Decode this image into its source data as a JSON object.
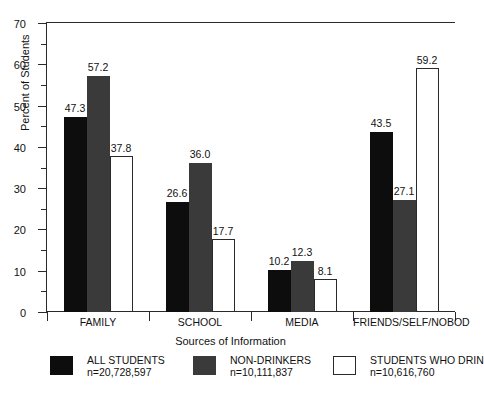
{
  "chart_data": {
    "type": "bar",
    "title": "",
    "xlabel": "Sources of Information",
    "ylabel": "Percent of Students",
    "ylim": [
      0,
      70
    ],
    "ytick_step": 10,
    "yminor_step": 5,
    "grid": false,
    "legend_position": "bottom",
    "categories": [
      "FAMILY",
      "SCHOOL",
      "MEDIA",
      "FRIENDS/SELF/NOBOD"
    ],
    "yticks": [
      "0",
      "10",
      "20",
      "30",
      "40",
      "50",
      "60",
      "70"
    ],
    "series": [
      {
        "name": "ALL STUDENTS",
        "n": "n=20,728,597",
        "color": "#0d0d0d",
        "values": [
          47.3,
          26.6,
          10.2,
          43.5
        ],
        "labels": [
          "47.3",
          "26.6",
          "10.2",
          "43.5"
        ]
      },
      {
        "name": "NON-DRINKERS",
        "n": "n=10,111,837",
        "color": "#3a3a3a",
        "values": [
          57.2,
          36.0,
          12.3,
          27.1
        ],
        "labels": [
          "57.2",
          "36.0",
          "12.3",
          "27.1"
        ]
      },
      {
        "name": "STUDENTS WHO DRIN",
        "n": "n=10,616,760",
        "color": "#ffffff",
        "values": [
          37.8,
          17.7,
          8.1,
          59.2
        ],
        "labels": [
          "37.8",
          "17.7",
          "8.1",
          "59.2"
        ]
      }
    ]
  },
  "axis": {
    "y_title": "Percent of Students",
    "x_title": "Sources of Information"
  }
}
